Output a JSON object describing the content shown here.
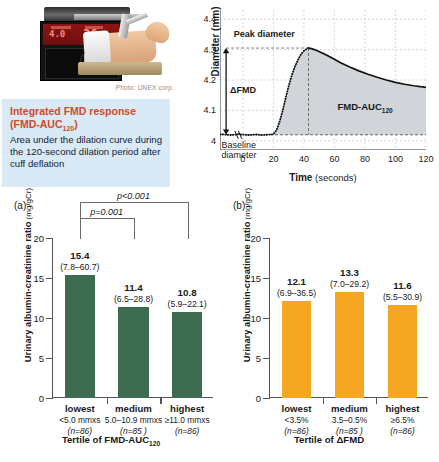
{
  "photo": {
    "credit": "Photo: UNEX corp."
  },
  "infobox": {
    "title_line1": "Integrated FMD response",
    "title_line2_pre": "(FMD-AUC",
    "title_line2_sub": "120",
    "title_line2_post": ")",
    "body": "Area under the dilation curve during the 120-second dilation period after cuff deflation",
    "bg_color": "#d9e9f5",
    "title_color": "#d2492a"
  },
  "line_chart": {
    "ylabel": "Diameter (mm)",
    "xlabel_bold": "Time",
    "xlabel_rest": " (seconds)",
    "annotations": {
      "peak": "Peak diameter",
      "delta": "ΔFMD",
      "baseline_l1": "Baseline",
      "baseline_l2": "diameter",
      "auc_pre": "FMD-AUC",
      "auc_sub": "120"
    }
  },
  "panel_a": {
    "label": "(a)",
    "ylabel_bold": "Urinary albumin-creatinine ratio",
    "ylabel_unit": " (mg/gCr)",
    "xtitle_pre": "Tertile of FMD-AUC",
    "xtitle_sub": "120",
    "bar_color": "#3c6b50",
    "sig": [
      {
        "text": "p<0.001",
        "from": 0,
        "to": 2
      },
      {
        "text": "p=0.001",
        "from": 0,
        "to": 1
      }
    ]
  },
  "panel_b": {
    "label": "(b)",
    "ylabel_bold": "Urinary albumin-creatinine ratio",
    "ylabel_unit": " (mg/gCr)",
    "xtitle": "Tertile of ΔFMD",
    "bar_color": "#f5a623",
    "sig": []
  },
  "chart_data": [
    {
      "type": "line",
      "id": "fmd-response-curve",
      "title": "",
      "xlabel": "Time (seconds)",
      "ylabel": "Diameter (mm)",
      "xlim": [
        -15,
        120
      ],
      "ylim": [
        3.97,
        4.43
      ],
      "xticks": [
        0,
        20,
        40,
        60,
        80,
        100,
        120
      ],
      "yticks": [
        4,
        4.1,
        4.2,
        4.3,
        4.4
      ],
      "ytick_labels": [
        "4",
        "4.1",
        "4.2",
        "4.3",
        "4.4"
      ],
      "grid": true,
      "legend": "none",
      "shaded_area": {
        "label": "FMD-AUC120",
        "x_from": 20,
        "x_to": 120,
        "baseline_y": 4.02,
        "fill": "#c9cdd1"
      },
      "markers": {
        "baseline_diameter": 4.02,
        "peak_diameter": 4.305,
        "peak_time": 43,
        "delta_fmd": 0.285
      },
      "x": [
        -15,
        -12,
        -9,
        -6,
        -3,
        0,
        3,
        6,
        9,
        12,
        15,
        18,
        20,
        22,
        24,
        26,
        28,
        30,
        32,
        34,
        36,
        38,
        40,
        42,
        43,
        45,
        48,
        52,
        56,
        60,
        64,
        70,
        76,
        82,
        88,
        94,
        100,
        106,
        112,
        120
      ],
      "y": [
        4.022,
        4.021,
        4.019,
        4.02,
        4.022,
        4.021,
        4.019,
        4.02,
        4.021,
        4.019,
        4.02,
        4.021,
        4.022,
        4.035,
        4.062,
        4.098,
        4.14,
        4.18,
        4.215,
        4.243,
        4.265,
        4.284,
        4.296,
        4.303,
        4.305,
        4.303,
        4.298,
        4.289,
        4.279,
        4.268,
        4.257,
        4.243,
        4.23,
        4.219,
        4.209,
        4.2,
        4.192,
        4.186,
        4.181,
        4.176
      ]
    },
    {
      "type": "bar",
      "id": "panel-a",
      "title": "(a)",
      "xlabel": "Tertile of FMD-AUC120",
      "ylabel": "Urinary albumin-creatinine ratio (mg/gCr)",
      "ylim": [
        0,
        20
      ],
      "yticks": [
        0,
        5,
        10,
        15,
        20
      ],
      "grid": false,
      "legend": "none",
      "color": "#3c6b50",
      "categories": [
        "lowest",
        "medium",
        "highest"
      ],
      "category_ranges": [
        "<5.0 mmxs",
        "5.0–10.9 mmxs",
        "≥11.0 mmxs"
      ],
      "category_counts": [
        "(n=86)",
        "(n=85 )",
        "(n=86)"
      ],
      "values": [
        15.4,
        11.4,
        10.8
      ],
      "value_labels": [
        "15.4",
        "11.4",
        "10.8"
      ],
      "ci_labels": [
        "(7.8–60.7)",
        "(6.5–28.8)",
        "(5.9–22.1)"
      ]
    },
    {
      "type": "bar",
      "id": "panel-b",
      "title": "(b)",
      "xlabel": "Tertile of ΔFMD",
      "ylabel": "Urinary albumin-creatinine ratio (mg/gCr)",
      "ylim": [
        0,
        20
      ],
      "yticks": [
        0,
        5,
        10,
        15,
        20
      ],
      "grid": false,
      "legend": "none",
      "color": "#f5a623",
      "categories": [
        "lowest",
        "medium",
        "highest"
      ],
      "category_ranges": [
        "<3.5%",
        "3.5–0.5%",
        "≥6.5%"
      ],
      "category_counts": [
        "(n=86)",
        "(n=85 )",
        "(n=86)"
      ],
      "values": [
        12.1,
        13.3,
        11.6
      ],
      "value_labels": [
        "12.1",
        "13.3",
        "11.6"
      ],
      "ci_labels": [
        "(6.9–36.5)",
        "(7.0–29.2)",
        "(5.5–30.9)"
      ]
    }
  ]
}
